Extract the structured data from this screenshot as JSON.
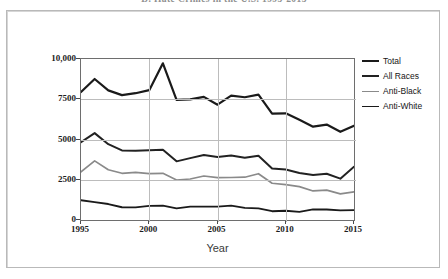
{
  "page": {
    "title_fragment": "D. Hate Crimes in the U.S. 1995-2015"
  },
  "figure": {
    "x_axis_title": "Year"
  },
  "legend": {
    "position": "right",
    "items": [
      {
        "label": "Total",
        "color": "#1a1a1a",
        "width": 2.2
      },
      {
        "label": "All Races",
        "color": "#222222",
        "width": 2.0
      },
      {
        "label": "Anti-Black",
        "color": "#8a8a8a",
        "width": 1.7
      },
      {
        "label": "Anti-White",
        "color": "#1a1a1a",
        "width": 1.8
      }
    ]
  },
  "axes": {
    "y_ticks": [
      "0",
      "2500",
      "5000",
      "7500",
      "10,000"
    ],
    "y_tick_values": [
      0,
      2500,
      5000,
      7500,
      10000
    ],
    "x_ticks": [
      "1995",
      "2000",
      "2005",
      "2010",
      "2015"
    ],
    "x_tick_values": [
      1995,
      2000,
      2005,
      2010,
      2015
    ],
    "grid": "both"
  },
  "chart_data": {
    "type": "line",
    "title": "D. Hate Crimes in the U.S. 1995-2015",
    "xlabel": "Year",
    "ylabel": "",
    "xlim": [
      1995,
      2015
    ],
    "ylim": [
      0,
      10000
    ],
    "grid": true,
    "legend_position": "right",
    "x": [
      1995,
      1996,
      1997,
      1998,
      1999,
      2000,
      2001,
      2002,
      2003,
      2004,
      2005,
      2006,
      2007,
      2008,
      2009,
      2010,
      2011,
      2012,
      2013,
      2014,
      2015
    ],
    "series": [
      {
        "name": "Total",
        "color": "#1a1a1a",
        "values": [
          7947,
          8759,
          8049,
          7755,
          7876,
          8063,
          9730,
          7462,
          7489,
          7649,
          7163,
          7722,
          7624,
          7783,
          6604,
          6628,
          6222,
          5796,
          5928,
          5479,
          5850
        ]
      },
      {
        "name": "All Races",
        "color": "#222222",
        "values": [
          4831,
          5396,
          4710,
          4321,
          4295,
          4337,
          4367,
          3642,
          3844,
          4042,
          3919,
          4000,
          3870,
          3992,
          3199,
          3135,
          2917,
          2797,
          2871,
          2568,
          3310
        ]
      },
      {
        "name": "Anti-Black",
        "color": "#8a8a8a",
        "values": [
          2988,
          3674,
          3120,
          2901,
          2958,
          2884,
          2899,
          2486,
          2548,
          2731,
          2630,
          2640,
          2658,
          2876,
          2284,
          2201,
          2076,
          1805,
          1856,
          1621,
          1745
        ]
      },
      {
        "name": "Anti-White",
        "color": "#1a1a1a",
        "values": [
          1226,
          1106,
          993,
          792,
          781,
          875,
          891,
          719,
          830,
          829,
          828,
          890,
          749,
          716,
          545,
          575,
          504,
          657,
          653,
          593,
          613
        ]
      }
    ]
  }
}
